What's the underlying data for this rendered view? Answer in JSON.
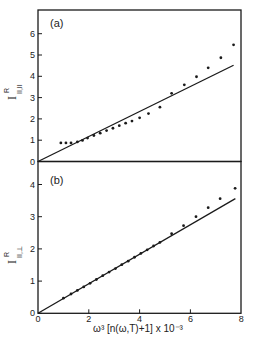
{
  "chart_data": [
    {
      "type": "scatter",
      "panel": "(a)",
      "title": "",
      "xlabel": "ω³ [n(ω,T)+1] x 10⁻³",
      "ylabel": "I^R_{||,||}",
      "ylabel_main": "I",
      "ylabel_sup": "R",
      "ylabel_sub": "||,||",
      "xlim": [
        0,
        8
      ],
      "ylim": [
        0,
        7
      ],
      "x_ticks": [
        0,
        2,
        4,
        6,
        8
      ],
      "y_ticks": [
        0,
        1,
        2,
        3,
        4,
        5,
        6
      ],
      "grid": false,
      "series": [
        {
          "name": "data",
          "style": "points",
          "x": [
            0.9,
            1.1,
            1.3,
            1.55,
            1.75,
            1.95,
            2.2,
            2.45,
            2.7,
            2.95,
            3.2,
            3.45,
            3.7,
            4.0,
            4.35,
            4.8,
            5.26,
            5.76,
            6.24,
            6.7,
            7.2,
            7.7
          ],
          "y": [
            0.87,
            0.87,
            0.87,
            0.92,
            0.99,
            1.1,
            1.22,
            1.33,
            1.45,
            1.56,
            1.68,
            1.8,
            1.9,
            2.05,
            2.25,
            2.55,
            3.2,
            3.6,
            3.98,
            4.4,
            4.87,
            5.48
          ]
        },
        {
          "name": "linear fit",
          "style": "line",
          "x": [
            0,
            7.7
          ],
          "y": [
            0,
            4.52
          ]
        }
      ]
    },
    {
      "type": "scatter",
      "panel": "(b)",
      "title": "",
      "xlabel": "ω³ [n(ω,T)+1] x 10⁻³",
      "ylabel": "I^R_{||,⊥}",
      "ylabel_main": "I",
      "ylabel_sup": "R",
      "ylabel_sub": "||,⊥",
      "xlim": [
        0,
        8
      ],
      "ylim": [
        0,
        4.7
      ],
      "x_ticks": [
        0,
        2,
        4,
        6,
        8
      ],
      "y_ticks": [
        0,
        1,
        2,
        3,
        4
      ],
      "grid": false,
      "series": [
        {
          "name": "data",
          "style": "points",
          "x": [
            1.0,
            1.3,
            1.55,
            1.8,
            2.05,
            2.3,
            2.55,
            2.8,
            3.05,
            3.3,
            3.55,
            3.8,
            4.05,
            4.3,
            4.55,
            4.8,
            5.26,
            5.73,
            6.22,
            6.7,
            7.17,
            7.76
          ],
          "y": [
            0.47,
            0.6,
            0.71,
            0.82,
            0.93,
            1.05,
            1.17,
            1.28,
            1.39,
            1.51,
            1.62,
            1.74,
            1.86,
            1.97,
            2.09,
            2.2,
            2.47,
            2.72,
            3.0,
            3.28,
            3.56,
            3.88
          ]
        },
        {
          "name": "linear fit",
          "style": "line",
          "x": [
            0,
            7.77
          ],
          "y": [
            0,
            3.56
          ]
        }
      ]
    }
  ],
  "labels": {
    "panel_a": "(a)",
    "panel_b": "(b)",
    "x_axis_label": "ω³ [n(ω,T)+1]  x 10⁻³",
    "y_axis_a_main": "I",
    "y_axis_a_sup": "R",
    "y_axis_a_sub": "II,II",
    "y_axis_b_main": "I",
    "y_axis_b_sup": "R",
    "y_axis_b_sub": "II,⊥",
    "x_tick_labels": [
      "0",
      "2",
      "4",
      "6",
      "8"
    ],
    "y_tick_labels_a": [
      "0",
      "1",
      "2",
      "3",
      "4",
      "5",
      "6"
    ],
    "y_tick_labels_b": [
      "0",
      "1",
      "2",
      "3",
      "4"
    ]
  },
  "colors": {
    "ink": "#1a1a1a",
    "background": "#ffffff"
  }
}
